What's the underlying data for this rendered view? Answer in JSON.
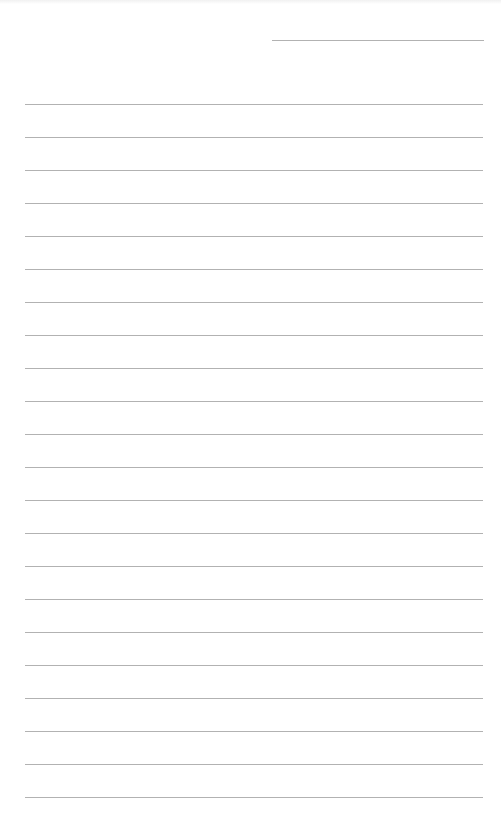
{
  "page": {
    "type": "lined-paper",
    "background_color": "#ffffff",
    "line_color": "#b2b2b2"
  },
  "header_line": {
    "top": 40,
    "left": 272,
    "width": 212
  },
  "ruled_lines": {
    "left": 25,
    "width": 458,
    "first_top": 104,
    "spacing": 33,
    "count": 22
  }
}
